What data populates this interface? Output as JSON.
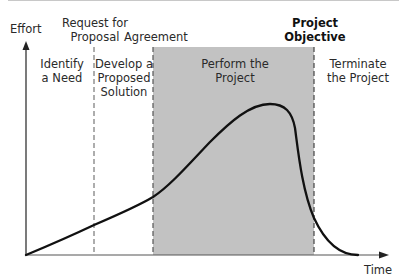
{
  "diagram": {
    "axes": {
      "y_label": "Effort",
      "x_label": "Time"
    },
    "milestones": [
      {
        "id": "rfp",
        "label_lines": [
          "Request for",
          "Proposal"
        ],
        "bold": false
      },
      {
        "id": "agreement",
        "label_lines": [
          "Agreement"
        ],
        "bold": false
      },
      {
        "id": "objective",
        "label_lines": [
          "Project",
          "Objective"
        ],
        "bold": true
      }
    ],
    "phases": [
      {
        "id": "identify",
        "label_lines": [
          "Identify",
          "a Need"
        ],
        "shaded": false
      },
      {
        "id": "develop",
        "label_lines": [
          "Develop a",
          "Proposed",
          "Solution"
        ],
        "shaded": false
      },
      {
        "id": "perform",
        "label_lines": [
          "Perform the",
          "Project"
        ],
        "shaded": true
      },
      {
        "id": "terminate",
        "label_lines": [
          "Terminate",
          "the Project"
        ],
        "shaded": false
      }
    ],
    "colors": {
      "shade": "#c2c2c2",
      "curve": "#111111",
      "axis": "#333333",
      "dash": "#666666"
    }
  },
  "labels": {
    "effort": "Effort",
    "time": "Time",
    "rfp_1": "Request for",
    "rfp_2": "Proposal",
    "agreement": "Agreement",
    "objective_1": "Project",
    "objective_2": "Objective",
    "identify_1": "Identify",
    "identify_2": "a Need",
    "develop_1": "Develop a",
    "develop_2": "Proposed",
    "develop_3": "Solution",
    "perform_1": "Perform the",
    "perform_2": "Project",
    "terminate_1": "Terminate",
    "terminate_2": "the Project"
  }
}
